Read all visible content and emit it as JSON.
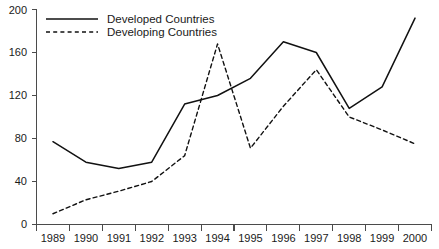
{
  "chart_data": {
    "type": "line",
    "title": "",
    "subtitle": "",
    "xlabel": "",
    "ylabel": "",
    "categories": [
      "1989",
      "1990",
      "1991",
      "1992",
      "1993",
      "1994",
      "1995",
      "1996",
      "1997",
      "1998",
      "1999",
      "2000"
    ],
    "x": [
      1989,
      1990,
      1991,
      1992,
      1993,
      1994,
      1995,
      1996,
      1997,
      1998,
      1999,
      2000
    ],
    "series": [
      {
        "name": "Developed Countries",
        "style": "solid",
        "color": "#111111",
        "values": [
          77,
          58,
          52,
          58,
          112,
          120,
          136,
          170,
          160,
          108,
          128,
          192
        ]
      },
      {
        "name": "Developing Countries",
        "style": "dashed",
        "color": "#111111",
        "values": [
          10,
          23,
          31,
          40,
          64,
          168,
          71,
          110,
          144,
          100,
          88,
          75
        ]
      }
    ],
    "ylim": [
      0,
      200
    ],
    "yticks": [
      0,
      40,
      80,
      120,
      160,
      200
    ],
    "ytick_labels": [
      "0",
      "40",
      "80",
      "120",
      "160",
      "200"
    ],
    "xlim": [
      1989,
      2000
    ],
    "grid": false,
    "legend_position": "top-left",
    "legend": [
      "Developed Countries",
      "Developing Countries"
    ]
  },
  "legend": {
    "entries": [
      {
        "label": "Developed Countries",
        "style": "solid"
      },
      {
        "label": "Developing Countries",
        "style": "dashed"
      }
    ]
  },
  "caption": {
    "footnote": ""
  }
}
